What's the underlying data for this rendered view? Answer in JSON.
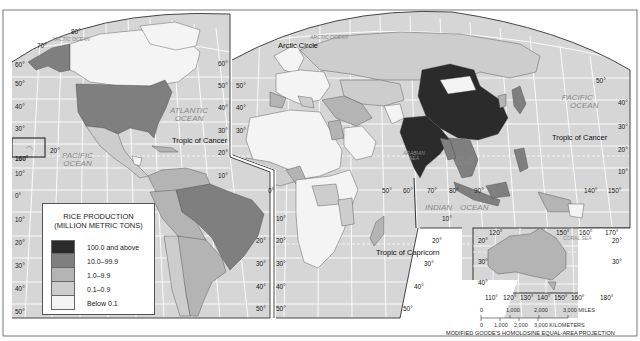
{
  "map": {
    "title": "RICE PRODUCTION",
    "subtitle": "(MILLION METRIC TONS)",
    "projection": "MODIFIED GOODE'S HOMOLOSINE EQUAL-AREA PROJECTION",
    "legend": [
      {
        "label": "100.0 and above",
        "color": "#2b2b2b"
      },
      {
        "label": "10.0–99.9",
        "color": "#7f7f7f"
      },
      {
        "label": "1.0–9.9",
        "color": "#b4b4b4"
      },
      {
        "label": "0.1–0.9",
        "color": "#cdcdcd"
      },
      {
        "label": "Below 0.1",
        "color": "#f4f4f4"
      }
    ],
    "colors": {
      "ocean": "#d6d6d6",
      "graticule": "#ffffff",
      "border": "#444444",
      "land_low": "#f4f4f4"
    },
    "oceans": {
      "arctic_left": "ARCTIC OCEAN",
      "arctic_right": "ARCTIC OCEAN",
      "atlantic_1": "ATLANTIC",
      "atlantic_2": "OCEAN",
      "pacific_w_1": "PACIFIC",
      "pacific_w_2": "OCEAN",
      "pacific_e_1": "PACIFIC",
      "pacific_e_2": "OCEAN",
      "indian_1": "INDIAN",
      "indian_2": "OCEAN",
      "arabian_1": "ARABIAN",
      "arabian_2": "SEA",
      "bengal_1": "BAY OF",
      "bengal_2": "BENGAL",
      "coral": "CORAL SEA"
    },
    "lines": {
      "arctic_circle": "Arctic Circle",
      "tropic_cancer_w": "Tropic of Cancer",
      "tropic_cancer_e": "Tropic of Cancer",
      "tropic_capricorn": "Tropic of Capricorn"
    },
    "lat_labels_left": [
      "60°",
      "50°",
      "40°",
      "30°",
      "10°",
      "0°",
      "10°",
      "20°",
      "30°",
      "40°",
      "50°"
    ],
    "lat_labels_mid_left": [
      "60°",
      "50°",
      "40°",
      "30°",
      "20°",
      "10°"
    ],
    "lat_labels_mid_right": [
      "50°",
      "40°",
      "30°"
    ],
    "lat_labels_right": [
      "40°",
      "30°",
      "20°",
      "10°"
    ],
    "top_labels": {
      "v80": "80°",
      "v70": "70°"
    },
    "hawaii": {
      "lon": "160°",
      "lat": "20°"
    },
    "lon_labels_south": [
      "50°",
      "60°",
      "70°",
      "80°",
      "90°"
    ],
    "lon_labels_se": [
      "140°",
      "150°"
    ],
    "africa_lat": [
      "0°",
      "10°",
      "20°",
      "30°",
      "40°",
      "50°"
    ],
    "sa_lat": [
      "20°",
      "30°",
      "40°",
      "50°"
    ],
    "indian_lat": [
      "10°",
      "20°",
      "30°",
      "40°",
      "50°"
    ],
    "inset": {
      "top": [
        "120°",
        "150°",
        "160°",
        "170°"
      ],
      "left": [
        "20°",
        "30°",
        "40°"
      ],
      "right": [
        "20°",
        "30°"
      ],
      "bottom": [
        "110°",
        "120°",
        "130°",
        "140°",
        "150°",
        "160°",
        "180°"
      ]
    },
    "scale": {
      "miles": [
        "0",
        "1,000",
        "2,000",
        "3,000 MILES"
      ],
      "km": [
        "0",
        "1,000",
        "2,000",
        "3,000 KILOMETERS"
      ]
    }
  }
}
